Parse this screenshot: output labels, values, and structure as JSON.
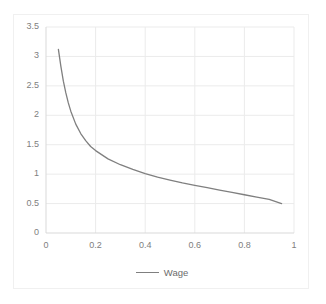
{
  "chart_data": {
    "type": "line",
    "title": "",
    "xlabel": "",
    "ylabel": "",
    "xlim": [
      0,
      1
    ],
    "ylim": [
      0,
      3.5
    ],
    "grid": true,
    "legend_position": "bottom-center",
    "x_ticks": [
      "0",
      "0.2",
      "0.4",
      "0.6",
      "0.8",
      "1"
    ],
    "x_tick_values": [
      0,
      0.2,
      0.4,
      0.6,
      0.8,
      1
    ],
    "y_ticks": [
      "0",
      "0.5",
      "1",
      "1.5",
      "2",
      "2.5",
      "3",
      "3.5"
    ],
    "y_tick_values": [
      0,
      0.5,
      1,
      1.5,
      2,
      2.5,
      3,
      3.5
    ],
    "series": [
      {
        "name": "Wage",
        "color": "#7f7f7f",
        "x": [
          0.05,
          0.06,
          0.07,
          0.08,
          0.09,
          0.1,
          0.12,
          0.14,
          0.16,
          0.18,
          0.2,
          0.25,
          0.3,
          0.35,
          0.4,
          0.45,
          0.5,
          0.55,
          0.6,
          0.65,
          0.7,
          0.75,
          0.8,
          0.85,
          0.9,
          0.95
        ],
        "values": [
          3.12,
          2.83,
          2.58,
          2.38,
          2.21,
          2.07,
          1.85,
          1.69,
          1.57,
          1.47,
          1.4,
          1.26,
          1.16,
          1.08,
          1.01,
          0.95,
          0.9,
          0.85,
          0.81,
          0.77,
          0.73,
          0.69,
          0.65,
          0.61,
          0.57,
          0.5
        ]
      }
    ]
  },
  "legend": {
    "entries": [
      {
        "label": "Wage"
      }
    ]
  },
  "axes": {
    "axis_color": "#d9d9d9",
    "grid_color": "#ebebeb",
    "tick_text_color": "#808080"
  }
}
